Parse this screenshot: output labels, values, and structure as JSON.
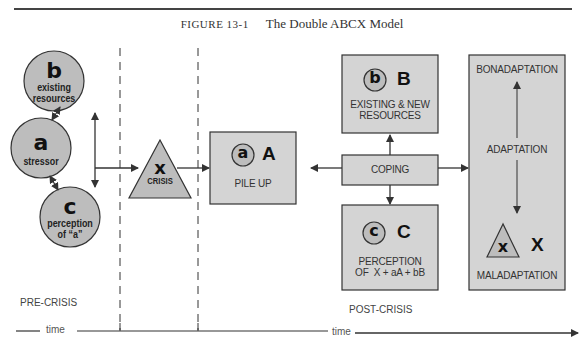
{
  "figure": {
    "number_label": "FIGURE 13-1",
    "title": "The Double ABCX Model"
  },
  "pre_crisis": {
    "circle_b": {
      "letter": "b",
      "label_line1": "existing",
      "label_line2": "resources"
    },
    "circle_a": {
      "letter": "a",
      "label": "stressor"
    },
    "circle_c": {
      "letter": "c",
      "label_line1": "perception",
      "label_line2": "of “a”"
    },
    "phase_label": "PRE-CRISIS"
  },
  "crisis": {
    "letter": "x",
    "label": "CRISIS"
  },
  "post_crisis": {
    "pileup_box": {
      "small_letter": "a",
      "big_letter": "A",
      "label": "PILE UP"
    },
    "resources_box": {
      "small_letter": "b",
      "big_letter": "B",
      "label_line1": "EXISTING & NEW",
      "label_line2": "RESOURCES"
    },
    "coping_box": {
      "label": "COPING"
    },
    "perception_box": {
      "small_letter": "c",
      "big_letter": "C",
      "label_line1": "PERCEPTION",
      "label_line2": "OF  X + aA + bB"
    },
    "adaptation_box": {
      "top_label": "BONADAPTATION",
      "middle_label": "ADAPTATION",
      "bottom_label": "MALADAPTATION",
      "small_letter": "x",
      "big_letter": "X"
    },
    "phase_label": "POST-CRISIS"
  },
  "timeline": {
    "left_label": "time",
    "right_label": "time"
  },
  "colors": {
    "fill_gray": "#c8c8c8",
    "box_fill": "#d4d4d4",
    "circle_fill": "#bdbdbd",
    "stroke": "#3a3a3a"
  }
}
